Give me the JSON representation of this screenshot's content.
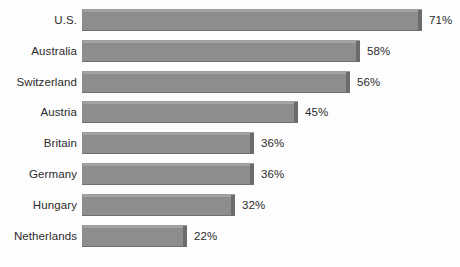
{
  "chart_data": {
    "type": "bar",
    "orientation": "horizontal",
    "title": "",
    "subtitle": "",
    "xlabel": "",
    "ylabel": "",
    "grid": false,
    "legend": false,
    "legend_position": "none",
    "axis_visible": false,
    "tick_labels": [],
    "xlim": [
      0,
      71
    ],
    "value_suffix": "%",
    "categories": [
      "U.S.",
      "Australia",
      "Switzerland",
      "Austria",
      "Britain",
      "Germany",
      "Hungary",
      "Netherlands"
    ],
    "values": [
      71,
      58,
      56,
      45,
      36,
      36,
      32,
      22
    ],
    "data_labels": [
      "71%",
      "58%",
      "56%",
      "45%",
      "36%",
      "36%",
      "32%",
      "22%"
    ],
    "colors": {
      "bar_fill": "#8d8d8d",
      "bar_top_highlight": "#a3a3a3",
      "bar_end_cap": "#6b6b6b",
      "bar_bottom_shadow": "#6f6f6f",
      "text": "#2b2b2b",
      "background": "#fdfdfd"
    }
  }
}
